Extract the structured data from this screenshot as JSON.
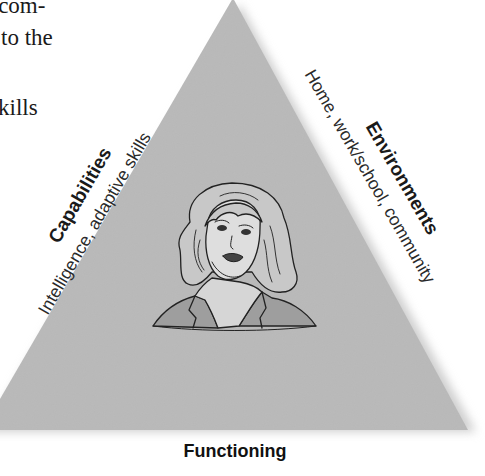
{
  "body_text_fragments": [
    {
      "text": "l com-",
      "top": -8,
      "left": -14
    },
    {
      "text": "to the",
      "top": 26,
      "left": 2
    },
    {
      "text": "kills",
      "top": 96,
      "left": -2
    }
  ],
  "diagram": {
    "shape": "triangle",
    "fill_color": "#b9b9b9",
    "sides": {
      "left": {
        "title": "Capabilities",
        "subtitle": "Intelligence, adaptive skills"
      },
      "right": {
        "title": "Environments",
        "subtitle": "Home, work/school, community"
      },
      "bottom": {
        "title": "Functioning"
      }
    },
    "center_image": "woman-portrait-illustration"
  }
}
